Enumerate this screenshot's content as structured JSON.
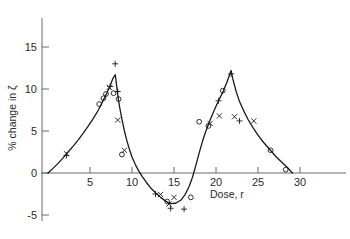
{
  "chart_data": {
    "type": "scatter",
    "title": "",
    "subtitle": "",
    "xlabel": "Dose, r",
    "ylabel": "% change in ζ",
    "xlim": [
      0,
      31
    ],
    "ylim": [
      -6,
      16.5
    ],
    "xticks": [
      5,
      10,
      15,
      20,
      25,
      30
    ],
    "xtick_labels": [
      "5",
      "10",
      "15",
      "20",
      "25",
      "30"
    ],
    "yticks": [
      -5,
      0,
      5,
      10,
      15
    ],
    "ytick_labels": [
      "-5",
      "0",
      "5",
      "10",
      "15"
    ],
    "grid": false,
    "legend": "none",
    "axis_style": "left-spine-and-zero-line",
    "curve": {
      "name": "fitted curve",
      "color": "#1a1a1a",
      "points": [
        [
          0.0,
          0.0
        ],
        [
          0.6,
          0.55
        ],
        [
          1.2,
          1.15
        ],
        [
          1.8,
          1.8
        ],
        [
          2.4,
          2.5
        ],
        [
          3.0,
          3.2
        ],
        [
          3.6,
          3.95
        ],
        [
          4.2,
          4.75
        ],
        [
          4.8,
          5.6
        ],
        [
          5.4,
          6.5
        ],
        [
          6.0,
          7.5
        ],
        [
          6.5,
          8.5
        ],
        [
          7.0,
          9.5
        ],
        [
          7.4,
          10.4
        ],
        [
          7.7,
          11.2
        ],
        [
          8.0,
          11.7
        ],
        [
          8.15,
          10.6
        ],
        [
          8.3,
          9.3
        ],
        [
          8.5,
          8.0
        ],
        [
          8.8,
          6.4
        ],
        [
          9.1,
          5.0
        ],
        [
          9.4,
          3.8
        ],
        [
          9.7,
          2.8
        ],
        [
          10.0,
          1.9
        ],
        [
          10.4,
          1.0
        ],
        [
          10.8,
          0.25
        ],
        [
          11.2,
          -0.4
        ],
        [
          11.7,
          -1.1
        ],
        [
          12.2,
          -1.75
        ],
        [
          12.8,
          -2.35
        ],
        [
          13.4,
          -2.9
        ],
        [
          14.0,
          -3.35
        ],
        [
          14.6,
          -3.65
        ],
        [
          15.2,
          -3.6
        ],
        [
          15.8,
          -3.25
        ],
        [
          16.3,
          -2.6
        ],
        [
          16.8,
          -1.6
        ],
        [
          17.2,
          -0.5
        ],
        [
          17.6,
          0.9
        ],
        [
          18.0,
          2.4
        ],
        [
          18.4,
          3.8
        ],
        [
          18.8,
          5.0
        ],
        [
          19.3,
          6.3
        ],
        [
          19.8,
          7.5
        ],
        [
          20.3,
          8.6
        ],
        [
          20.8,
          9.6
        ],
        [
          21.3,
          10.8
        ],
        [
          21.8,
          12.2
        ],
        [
          22.0,
          11.2
        ],
        [
          22.4,
          9.7
        ],
        [
          22.8,
          8.5
        ],
        [
          23.3,
          7.4
        ],
        [
          23.8,
          6.4
        ],
        [
          24.4,
          5.4
        ],
        [
          25.0,
          4.5
        ],
        [
          25.7,
          3.6
        ],
        [
          26.4,
          2.8
        ],
        [
          27.1,
          2.0
        ],
        [
          27.8,
          1.3
        ],
        [
          28.5,
          0.65
        ],
        [
          29.1,
          0.0
        ]
      ]
    },
    "series": [
      {
        "name": "circle markers",
        "marker": "circle",
        "color": "#1a1a1a",
        "points": [
          [
            6.1,
            8.2
          ],
          [
            6.6,
            8.9
          ],
          [
            6.9,
            9.4
          ],
          [
            7.8,
            9.5
          ],
          [
            8.4,
            8.8
          ],
          [
            8.8,
            2.2
          ],
          [
            14.2,
            -3.4
          ],
          [
            17.0,
            -2.9
          ],
          [
            18.0,
            6.1
          ],
          [
            19.1,
            5.6
          ],
          [
            20.8,
            9.8
          ],
          [
            26.5,
            2.7
          ],
          [
            28.3,
            0.4
          ]
        ]
      },
      {
        "name": "cross markers",
        "marker": "cross",
        "color": "#1a1a1a",
        "points": [
          [
            2.2,
            2.3
          ],
          [
            7.3,
            10.2
          ],
          [
            8.3,
            6.3
          ],
          [
            9.1,
            2.7
          ],
          [
            13.4,
            -2.55
          ],
          [
            14.4,
            -3.7
          ],
          [
            15.0,
            -2.9
          ],
          [
            19.3,
            5.9
          ],
          [
            20.4,
            6.8
          ],
          [
            22.2,
            6.7
          ],
          [
            24.5,
            6.2
          ]
        ]
      },
      {
        "name": "plus markers",
        "marker": "plus",
        "color": "#1a1a1a",
        "points": [
          [
            2.2,
            2.1
          ],
          [
            7.4,
            10.3
          ],
          [
            8.0,
            13.0
          ],
          [
            8.3,
            9.7
          ],
          [
            12.8,
            -2.5
          ],
          [
            14.6,
            -4.2
          ],
          [
            16.2,
            -4.3
          ],
          [
            20.3,
            8.6
          ],
          [
            21.8,
            11.8
          ],
          [
            22.8,
            6.2
          ]
        ]
      }
    ]
  }
}
